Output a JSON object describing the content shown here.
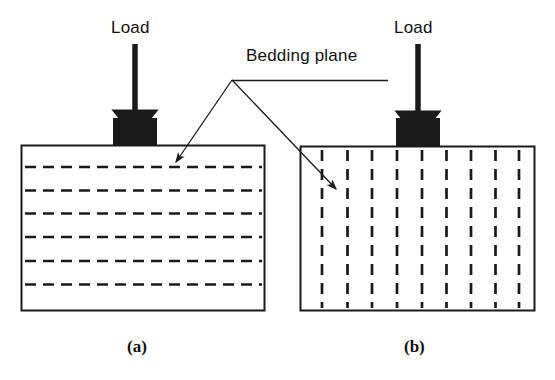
{
  "figure": {
    "background_color": "#ffffff",
    "ink_color": "#1a1a1a",
    "width": 555,
    "height": 380
  },
  "annotations": {
    "bedding_plane_label": "Bedding plane",
    "load_label_left": "Load",
    "load_label_right": "Load",
    "panel_label_a": "(a)",
    "panel_label_b": "(b)"
  },
  "panel_a": {
    "caption": "(a)",
    "bedding_orientation": "horizontal",
    "block": {
      "x": 21,
      "y": 145,
      "width": 244,
      "height": 166
    },
    "loading_plate": {
      "x": 113,
      "y": 118,
      "width": 44,
      "height": 27,
      "color": "#1a1a1a"
    },
    "bedding_lines_y": [
      167,
      190,
      213,
      237,
      261,
      284
    ],
    "bedding_line_count": 6,
    "dash_pattern": "11 7"
  },
  "panel_b": {
    "caption": "(b)",
    "bedding_orientation": "vertical",
    "block": {
      "x": 300,
      "y": 146,
      "width": 235,
      "height": 165
    },
    "loading_plate": {
      "x": 396,
      "y": 118,
      "width": 44,
      "height": 28,
      "color": "#1a1a1a"
    },
    "bedding_lines_x": [
      322,
      348,
      372,
      397,
      422,
      447,
      471,
      495,
      519
    ],
    "bedding_line_count": 9,
    "dash_pattern": "11 8"
  },
  "load_arrow_left": {
    "x": 135,
    "y_start": 44,
    "y_end": 118
  },
  "load_arrow_right": {
    "x": 418,
    "y_start": 44,
    "y_end": 118
  },
  "leader": {
    "vertex": {
      "x": 232,
      "y": 80
    },
    "horizontal_end": {
      "x": 388,
      "y": 80
    },
    "arrow_left_tip": {
      "x": 172,
      "y": 167
    },
    "arrow_right_tip": {
      "x": 341,
      "y": 194
    }
  },
  "text_positions": {
    "bedding_plane": {
      "left": 246,
      "top": 46
    },
    "load_left": {
      "left": 111,
      "top": 18
    },
    "load_right": {
      "left": 394,
      "top": 18
    },
    "panel_a": {
      "left": 127,
      "top": 337
    },
    "panel_b": {
      "left": 404,
      "top": 337
    }
  }
}
